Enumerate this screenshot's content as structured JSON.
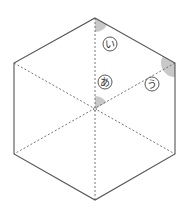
{
  "figure": {
    "shape": "regular-hexagon",
    "colors": {
      "edge": "#555555",
      "diagonal": "#666666",
      "angle_fill": "#c8c8c8",
      "label_stroke": "#444444",
      "background": "#ffffff"
    },
    "angles": [
      {
        "id": "a",
        "label": "あ",
        "location": "center",
        "between": [
          "center-to-top",
          "center-to-upper-right"
        ]
      },
      {
        "id": "i",
        "label": "い",
        "location": "top-vertex",
        "between": [
          "top-to-center",
          "top-to-upper-right"
        ]
      },
      {
        "id": "u",
        "label": "う",
        "location": "upper-right-vertex",
        "between": [
          "upper-right-to-top",
          "upper-right-to-lower-right"
        ]
      }
    ]
  }
}
